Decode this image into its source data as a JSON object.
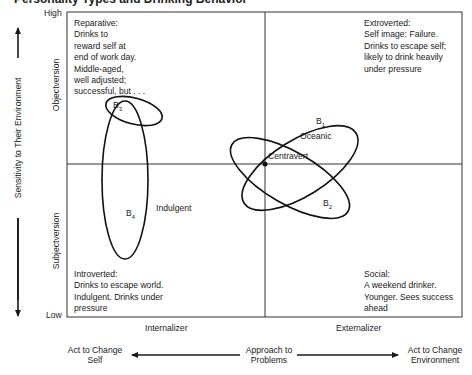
{
  "title": "Personality Types and Drinking Behavior",
  "y_axis": {
    "label": "Sensitivity to Their Environment",
    "high": "High",
    "low": "Low",
    "upper_region": "Objectversion",
    "lower_region": "Subjectversion"
  },
  "x_axis": {
    "left_region": "Internalizer",
    "right_region": "Externalizer",
    "center_label_lines": [
      "Approach to",
      "Problems"
    ],
    "left_end_lines": [
      "Act to Change",
      "Self"
    ],
    "right_end_lines": [
      "Act to Change",
      "Environment"
    ]
  },
  "quadrants": {
    "top_left": {
      "lines": [
        "Reparative:",
        "Drinks to",
        "reward self at",
        "end of work day.",
        "Middle-aged,",
        "well adjusted;",
        "successful, but . . ."
      ]
    },
    "top_right": {
      "lines": [
        "Extroverted:",
        "Self image:  Failure.",
        "Drinks to escape self;",
        "likely to drink heavily",
        "under pressure"
      ]
    },
    "bottom_left": {
      "lines": [
        "Introverted:",
        "Drinks to escape world.",
        "Indulgent.  Drinks under",
        "pressure"
      ]
    },
    "bottom_right": {
      "lines": [
        "Social:",
        "A weekend drinker.",
        "Younger. Sees success",
        "ahead"
      ]
    }
  },
  "clusters": {
    "b1": {
      "label": "B",
      "sub": "1"
    },
    "b2": {
      "label": "B",
      "sub": "2"
    },
    "b3": {
      "label": "B",
      "sub": "3"
    },
    "b4": {
      "label": "B",
      "sub": "4"
    },
    "oceanic": "Oceanic",
    "centravert": "Centravert",
    "indulgent": "Indulgent"
  },
  "colors": {
    "ink": "#1a1a1a",
    "background": "#ffffff"
  }
}
